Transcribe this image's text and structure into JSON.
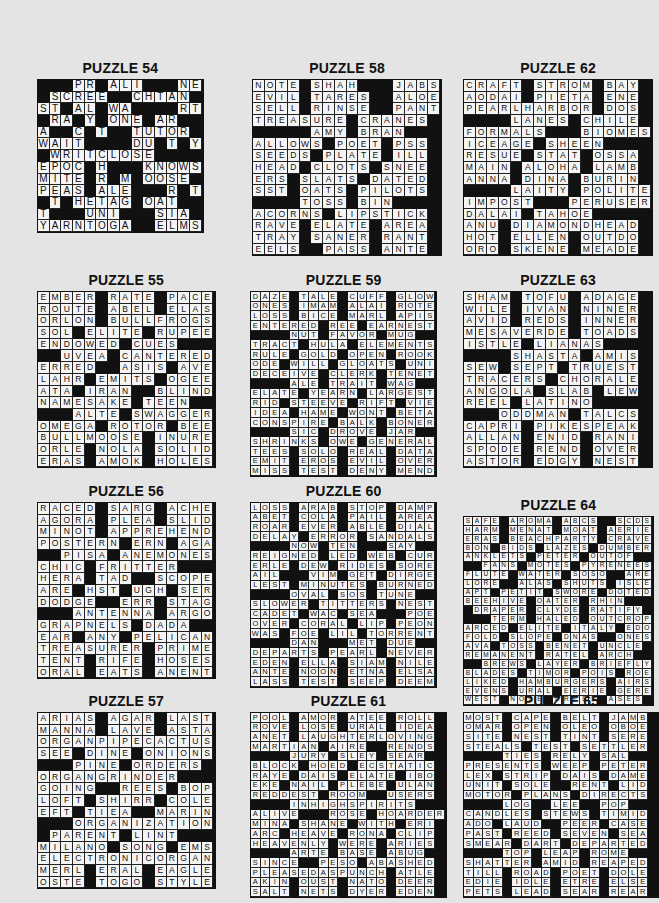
{
  "page": {
    "background": "#e4e4e4",
    "cell_color": "#f4f4f4",
    "block_color": "#111111"
  },
  "puzzles": [
    {
      "id": "p54",
      "title": "PUZZLE 54",
      "x": 37,
      "y": 60,
      "cell": 11.7,
      "font": 10,
      "rows": [
        "###PR#ALI###NE",
        "#SCREE##CHTAN#",
        "ST#AL#WA####RT",
        "#RA#Y#ONE#AR##",
        "A##C#T##TUTOR#",
        "WAIT####DU#T#Y",
        "#WRITCLOSE####",
        "EPOC#H###KNOWS",
        "MITE#R#M#OOSE#",
        "PEAS#ALE###R#T",
        "#T#HETAG#OAT##",
        "T###UNI###SIA#",
        "YARNTOGA##ELMS"
      ]
    },
    {
      "id": "p58",
      "title": "PUZZLE 58",
      "x": 252,
      "y": 60,
      "cell": 11.7,
      "font": 8.5,
      "rows": [
        "NOTE#SHAH###JABS",
        "EVIL#TARES##ALOE",
        "SELL#RINSE##PANT",
        "TREASURE#CRANES",
        "#####AMY#BRAN##",
        "ALLOWS#POET#PSS",
        "SEEDS#PLATE#ILL",
        "HEAD#CLOTS#SNEE",
        "ERS#SLATS#DATED",
        "SST#OATS#PILOTS",
        "####TOSS#BIN###",
        "ACORNS#LIPSTICK",
        "RAVE#ELATE#AREA",
        "TRAY#SANER#RANT",
        "EELS##PASS#ANTE"
      ]
    },
    {
      "id": "p62",
      "title": "PUZZLE 62",
      "x": 463,
      "y": 60,
      "cell": 11.7,
      "font": 8.5,
      "rows": [
        "CRAFT#STROM#BAY",
        "AODAI#PIETA#ENE",
        "PEARLHARBOR#DOS",
        "####LANES#CHILE",
        "FORMALS###BIOMES",
        "ICEAGE#SHEEN###",
        "RESUE#STAT#OSSA",
        "MAIN#ALOHA#LAMB",
        "ANNA#DINA#BURIN",
        "####LAITY#POLITE",
        "IMPOST###PERUSER",
        "DALAI#TAHOE####",
        "ANU#DIAMONDHEAD",
        "HOT#ELLEN#OUTDO",
        "ORO#SKENE#MEADE"
      ]
    },
    {
      "id": "p55",
      "title": "PUZZLE 55",
      "x": 37,
      "y": 272,
      "cell": 11.7,
      "font": 8.5,
      "rows": [
        "EMBER#RATE#PACE",
        "ROUTE#ABEL#ELAS",
        "ORLON#BULLFROGS",
        "SOL#ELITE#RUPEE",
        "ENDOWED#CUES###",
        "##UVEA#CANTERED",
        "ERRED##ASIS#AVE",
        "LAHR#EMITS#OGEE",
        "ATA#IRAN##BLIND",
        "NAMESAKE#TEEN##",
        "###ALTE#SWAGGER",
        "OMEGA#ROTOR#BEE",
        "BULLMOOSE#INURE",
        "ORLE#NOLA#SOLID",
        "ERAS#AMOK#HOLES"
      ]
    },
    {
      "id": "p59",
      "title": "PUZZLE 59",
      "x": 250,
      "y": 272,
      "cell": 9.7,
      "font": 7.5,
      "rows": [
        "DAZE#TALE#CUFF#GLOW",
        "ONES#IMAM#ALAI#ROTE",
        "LOSS#BICE#MARL#APIS",
        "ENTERED#REE#EARNEST",
        "####NUT#FAVOR#MUG##",
        "TRACT#HULA#ELEMENTS",
        "RULE#GOLD#OPEN#ROOK",
        "ODE#WILL#GLOATS#UNI",
        "DECEIVE#CLERK#TENET",
        "####ALE#TRAIT#WAG##",
        "ELATE#YEARN#LARGEST",
        "RID#STEEVE#RIFT#VIE",
        "IDEA#HAME#WONT#BETA",
        "CONSPIRE#BALK#BONER",
        "####SIC#DROVE#JAR##",
        "SHRINKS#OWE#GENERAL",
        "TEES#SOLO#REAL#DATA",
        "EMIT#EROS#EVIL#OVER",
        "MISS#TEST#DENY#MEND"
      ]
    },
    {
      "id": "p63",
      "title": "PUZZLE 63",
      "x": 463,
      "y": 272,
      "cell": 11.7,
      "font": 8.5,
      "rows": [
        "SHAM#TOFU#ADAGE",
        "WILE#IVAN#NINER",
        "AVID#REDS#INNER",
        "MESAVERDE#TOADS",
        "ISTLE#LIANAS###",
        "####SHASTA#AMIS",
        "SEW#SEPT#TRUEST",
        "TRACERS#CHORALE",
        "ANGOLA#SLAB#LEW",
        "REEL#LATINO#####",
        "###ODDMAN#TALCS",
        "CAPRI#PIKESPEAK",
        "ALLAN#ENID#RANI",
        "SPODE#REND#OVER",
        "ASTOR#EDGY#NEST"
      ]
    },
    {
      "id": "p56",
      "title": "PUZZLE 56",
      "x": 37,
      "y": 483,
      "cell": 11.7,
      "font": 8.5,
      "rows": [
        "RACED#SARG#ACHE",
        "AGORA#PLEA#SLID",
        "MINOT#APPREHEND",
        "POSTERN#ERN#AGA",
        "##PISA#ANEMONES",
        "CHIC#FRITTER###",
        "HERA#TAD##SCOPE",
        "ARE#HST#UGH#SER",
        "DODGE##ERR#STAG",
        "###ANTENNA#ARGO",
        "GRAPNELS#DADA##",
        "EAR#ANY#PELICAN",
        "TREASURER#PRIME",
        "TENT#RIFE#HOSES",
        "ORAL#EATS#ANENT"
      ]
    },
    {
      "id": "p60",
      "title": "PUZZLE 60",
      "x": 250,
      "y": 483,
      "cell": 9.7,
      "font": 7.5,
      "rows": [
        "LOSS#ARAB#STOP#DAMP",
        "ABET#COLA#PAIL#AREA",
        "ROAR#EVER#ABLE#DIAL",
        "DELAY#ERROR#SANDALS",
        "####NOW#TEN###SAY##",
        "REIGNED#LED#WEB#CUR",
        "ERLE#DEW#RIDES#SORE",
        "AIL###VIM#GET#DIRGE",
        "LEST#MINUTES#BURNED",
        "####OVAL#SOS#TUNE##",
        "SLOWER#TITTERS#NEST",
        "CADET#WAC#SEA###POE",
        "OVER#CORAL#LIP#PEON",
        "WAS#FOE#LIL#TORRENT",
        "####DAN###MET#DUE##",
        "DEPARTS#PEARL#NEVER",
        "EDEN#ELLA#SIAM#NILE",
        "ANTE#NOON#ETNA#ELSA",
        "LASS#TEST#SEEP#DEEM"
      ]
    },
    {
      "id": "p64",
      "title": "PUZZLE 64",
      "x": 463,
      "y": 497,
      "cell": 8.95,
      "font": 6.5,
      "rows": [
        "SAFE#AROMA#ABCS##SCDS",
        "HARM#MENAT#MOAT#AERIE",
        "ERAS#BEACHPARTY#CRAVE",
        "BON#BIDS#LAZES#DUMBER",
        "ANKLETS#PETER#OUTOF##",
        "##FANS#MOTES#PYRENEES",
        "FLUTE#WATER#SOSO##ARE",
        "LORE##ALAS#SHUTS#ISLE",
        "APT#PETIT#SWORE#DOTED",
        "BEEHIVE#OATER#RHIN###",
        "#DRAPER#CLYDE#RATIFY#",
        "###TERM#HALED#OUTCROP",
        "ARCED#ELITE#ITALY#EDO",
        "FOLD#SLOPE#DNAS##ONES",
        "AVA#TOSS#BENET#UNCLE",
        "REMANENT#RATEL#ARCH##",
        "##BREWS#LAYER#BRIEFLY",
        "BLADES#TIMOR#POIS#ROE",
        "LIKED#HAMBURGERS#AIRS",
        "EVENS#URAL#EERIE#GERE",
        "WEST#NOSE#DRESS#ASES"
      ]
    },
    {
      "id": "p57",
      "title": "PUZZLE 57",
      "x": 37,
      "y": 693,
      "cell": 11.7,
      "font": 8.5,
      "rows": [
        "ARIAS#AGAR#LAST",
        "MANNA#LAVE#ASTA",
        "ORGANPIPECACTUS",
        "SEE#DINE#ONIONS",
        "###PINE#ORDERS#",
        "ORGANGRINDER###",
        "GOING##REES#BOP",
        "LOFT#SHIRR#COLE",
        "EFT#TIEA##MARIN",
        "###ORGANIZATION",
        "#PARENT#LINT###",
        "MILANO#SONG#EMS",
        "ELECTRONICORGAN",
        "MERL#ERAL#EAGLE",
        "OSTE#TOGO#STYLE"
      ]
    },
    {
      "id": "p61",
      "title": "PUZZLE 61",
      "x": 250,
      "y": 693,
      "cell": 9.7,
      "font": 7.5,
      "rows": [
        "POOL#AMOR#ATEE#ROLL",
        "ROVE#LOSE#URAL#IDEA",
        "ANET#LAUGHTERLOVING",
        "MARTIAN#AIRE##RENDS",
        "####JURY#SLEY#SEAR##",
        "BLOCK#HOED#ECSTATIC",
        "RAYE#DAIS#ELATE#IBO",
        "EKE#NAIL#PLEBE#ULAN",
        "REDDEST#ROOM##USERS",
        "####INHIGHSPIRITS###",
        "ALIVE###ROSE#HOARDER",
        "MINA#SHANE#WITH#ERI",
        "ARC#HEAVE#RONA#CLIP",
        "HEAVENLY#WERE#ARIES",
        "####ARTE#BASE#ABUG##",
        "SINCE##PESO#ABASHED",
        "PLEASEDASPUNCH#ATLE",
        "AKIN#OUST#NATO#DEER",
        "SALT#NETS#DYER#EDEN"
      ]
    },
    {
      "id": "p65",
      "title": "PUZZLE 65",
      "x": 463,
      "y": 693,
      "cell": 9.7,
      "font": 7.5,
      "rows": [
        "MOST#CAPE#BELT#JAMB",
        "OMAR#OPEN#OLEO#OBOE",
        "SITE#NEST#TINT#SERE",
        "STEALS#TEST#SETTLER",
        "####TIES#RELY#SAL##",
        "PRESENTS#WEEP#PETER",
        "LEX#STRIP#DAIS#DAME",
        "UNIT#SOLE##RENT#LID",
        "MOTOR#PLANS#DIRECTS",
        "####LOG##LEE##POP##",
        "CANDLES#STEWS#TIMID",
        "ADO#LAUD##PEER#CASE",
        "PAST#REED#SEVEN#SEA",
        "SMEAR#DART#DEPARTED",
        "####TOP#LEAP#ROME###",
        "SHATTER#AMID#REAPED",
        "TILL#ROAD#POET#DOLE",
        "EDIE#IDLE#ETRE#ELSE",
        "PETS#LEAD#SEAR#REAR"
      ]
    }
  ]
}
